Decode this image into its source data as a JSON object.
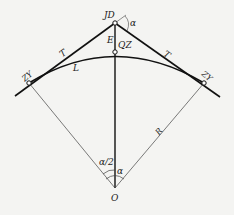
{
  "diagram": {
    "labels": {
      "jd": "JD",
      "alpha_top": "α",
      "e": "E",
      "qz": "QZ",
      "t_left": "T",
      "t_right": "T",
      "l": "L",
      "zy": "ZY",
      "yz": "ZY",
      "r": "R",
      "half_alpha": "α/2",
      "alpha_center": "α",
      "o": "O"
    },
    "colors": {
      "line": "#111111",
      "thin_line": "#444444",
      "background": "#f4f4f2"
    }
  }
}
